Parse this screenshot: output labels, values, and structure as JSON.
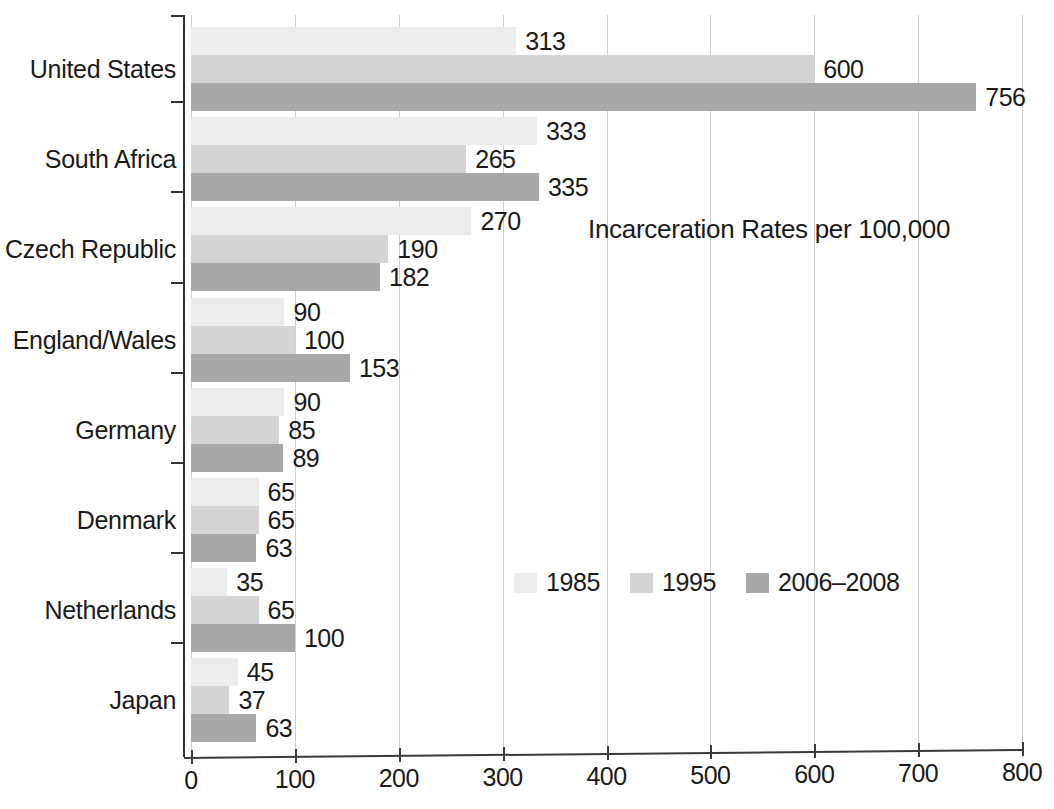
{
  "chart_data": {
    "type": "bar",
    "orientation": "horizontal",
    "title": "Incarceration Rates per 100,000",
    "xlabel": "",
    "ylabel": "",
    "xlim": [
      0,
      800
    ],
    "xticks": [
      0,
      100,
      200,
      300,
      400,
      500,
      600,
      700,
      800
    ],
    "grid": "vertical",
    "legend_position": "inside-lower-center",
    "categories": [
      "United States",
      "South Africa",
      "Czech Republic",
      "England/Wales",
      "Germany",
      "Denmark",
      "Netherlands",
      "Japan"
    ],
    "series": [
      {
        "name": "1985",
        "color": "#ececec",
        "values": [
          313,
          333,
          270,
          90,
          90,
          65,
          35,
          45
        ]
      },
      {
        "name": "1995",
        "color": "#d4d4d4",
        "values": [
          600,
          265,
          190,
          100,
          85,
          65,
          65,
          37
        ]
      },
      {
        "name": "2006–2008",
        "color": "#a8a8a8",
        "values": [
          756,
          335,
          182,
          153,
          89,
          63,
          100,
          63
        ]
      }
    ]
  },
  "legend": {
    "items": [
      {
        "label": "1985",
        "swatch": "s1985"
      },
      {
        "label": "1995",
        "swatch": "s1995"
      },
      {
        "label": "2006–2008",
        "swatch": "s200608"
      }
    ]
  },
  "axis": {
    "x_tick_labels": [
      "0",
      "100",
      "200",
      "300",
      "400",
      "500",
      "600",
      "700",
      "800"
    ]
  }
}
